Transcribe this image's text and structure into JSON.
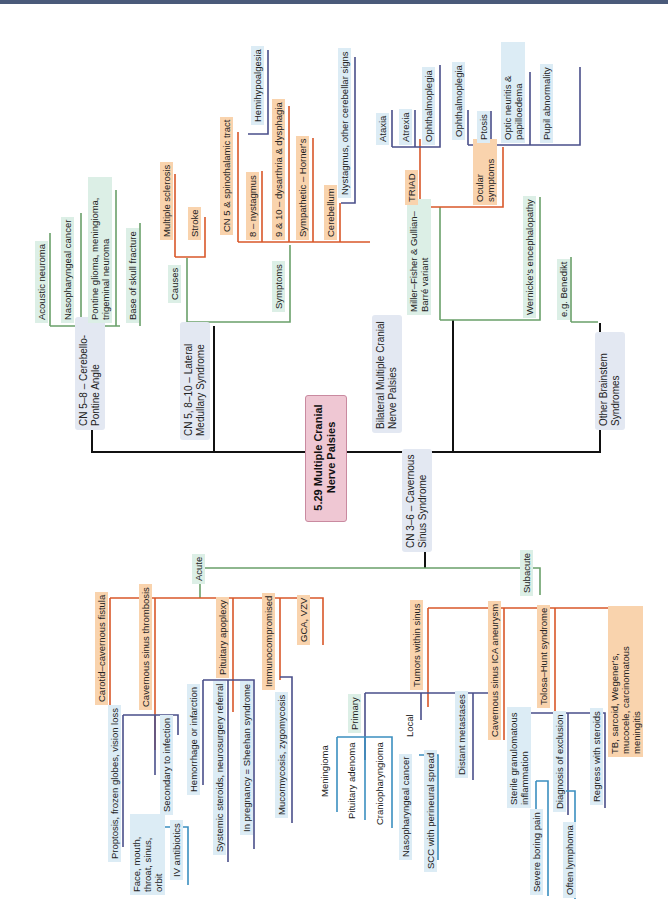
{
  "title": "5.29 Multiple Cranial Nerve Palsies",
  "colors": {
    "trunk": "#111111",
    "green": "#6aa06a",
    "orange": "#d9582a",
    "navy": "#4a4f8a",
    "teal": "#3b8fc0",
    "center_fill": "#efc7d3"
  },
  "branches": {
    "cpa": {
      "label": "CN 5–8 – Cerebello-Pontine Angle",
      "items": [
        "Acoustic neuroma",
        "Nasopharyngeal cancer",
        "Pontine glioma, meningioma, trigeminal neuroma",
        "Base of skull fracture"
      ]
    },
    "lateral_medullary": {
      "label": "CN 5, 8–10 – Lateral Medullary Syndrome",
      "causes": {
        "label": "Causes",
        "items": [
          "Multiple sclerosis",
          "Stroke"
        ]
      },
      "symptoms": {
        "label": "Symptoms",
        "items": [
          {
            "label": "CN 5 & spinothalamic tract",
            "child": "Hemihypoalgesia"
          },
          {
            "label": "8 – nystagmus"
          },
          {
            "label": "9 & 10 – dysarthria & dysphagia"
          },
          {
            "label": "Sympathetic – Horner's"
          },
          {
            "label": "Cerebellum",
            "child": "Nystagmus, other cerebellar signs"
          }
        ]
      }
    },
    "bilateral": {
      "label": "Bilateral Multiple Cranial Nerve Palsies",
      "miller_fisher": {
        "label": "Miller–Fisher & Gullian–Barré variant",
        "triad": {
          "label": "TRIAD",
          "items": [
            "Ataxia",
            "Atrexia",
            "Ophthalmoplegia"
          ]
        },
        "ocular": {
          "label": "Ocular symptoms",
          "items": [
            "Ophthalmoplegia",
            "Ptosis",
            "Optic neuritis & papilloedema",
            "Pupil abnormality"
          ]
        }
      },
      "wernicke": "Wernicke's encephalopathy"
    },
    "other": {
      "label": "Other Brainstem Syndromes",
      "items": [
        "e.g. Benedikt"
      ]
    },
    "cavernous": {
      "label": "CN 3–6 – Cavernous Sinus Syndrome",
      "acute": {
        "label": "Acute",
        "items": [
          {
            "label": "Carotid–cavernous fistula",
            "child": "Proptosis, frozen globes, vision loss"
          },
          {
            "label": "Cavernous sinus thrombosis",
            "child": "Secondary to infection",
            "grandchildren": [
              "Face, mouth, throat, sinus, orbit",
              "IV antibiotics"
            ]
          },
          {
            "label": "Pituitary apoplexy",
            "children": [
              "Hemorrhage or infarction",
              "Systemic steroids, neurosurgery referral",
              "In pregnancy = Sheehan syndrome"
            ]
          },
          {
            "label": "Immunocompromised",
            "child": "Mucormycosis, zygomycosis"
          },
          {
            "label": "GCA, VZV"
          }
        ]
      },
      "subacute": {
        "label": "Subacute",
        "items": [
          {
            "label": "Tumors within sinus",
            "primary": {
              "label": "Primary",
              "items": [
                "Meningioma",
                "Pituitary adenoma",
                "Craniopharyngioma"
              ]
            },
            "local": {
              "label": "Local",
              "items": [
                "Nasopharyngeal cancer",
                "SCC with perineural spread"
              ]
            },
            "distant": "Distant metastases"
          },
          {
            "label": "Cavernous sinus ICA aneurysm"
          },
          {
            "label": "Tolosa–Hunt syndrome",
            "children": [
              {
                "label": "Sterile granulomatous inflammation",
                "child": "Severe boring pain"
              },
              {
                "label": "Diagnosis of exclusion",
                "child": "Often lymphoma"
              },
              {
                "label": "Regress with steroids"
              }
            ]
          },
          {
            "label": "TB, sarcoid, Wegener's, mucocele, carcinomatous meningitis"
          }
        ]
      }
    }
  }
}
